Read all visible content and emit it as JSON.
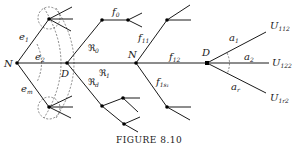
{
  "figure": {
    "caption": "FIGURE 8.10"
  },
  "nodes": {
    "N_left": "N",
    "D_left": "D",
    "N_mid": "N",
    "D_right": "D"
  },
  "edge_labels": {
    "e1": {
      "base": "e",
      "sub": "1"
    },
    "e2": {
      "base": "e",
      "sub": "2"
    },
    "em": {
      "base": "e",
      "sub": "m"
    },
    "R0": {
      "base": "ℜ",
      "sub": "0"
    },
    "R1": {
      "base": "ℜ",
      "sub": "1"
    },
    "Rd": {
      "base": "ℜ",
      "sub": "d"
    },
    "f0": {
      "base": "f",
      "sub": "0"
    },
    "f11": {
      "base": "f",
      "sub": "11"
    },
    "f12": {
      "base": "f",
      "sub": "12"
    },
    "f1s1": {
      "base": "f",
      "sub": "1s₁"
    },
    "a1": {
      "base": "a",
      "sub": "1"
    },
    "a2": {
      "base": "a",
      "sub": "2"
    },
    "ar": {
      "base": "a",
      "sub": "r"
    }
  },
  "terminals": {
    "U112": {
      "base": "U",
      "sub": "112"
    },
    "U122": {
      "base": "U",
      "sub": "122"
    },
    "U1r2": {
      "base": "U",
      "sub": "1r2"
    }
  }
}
